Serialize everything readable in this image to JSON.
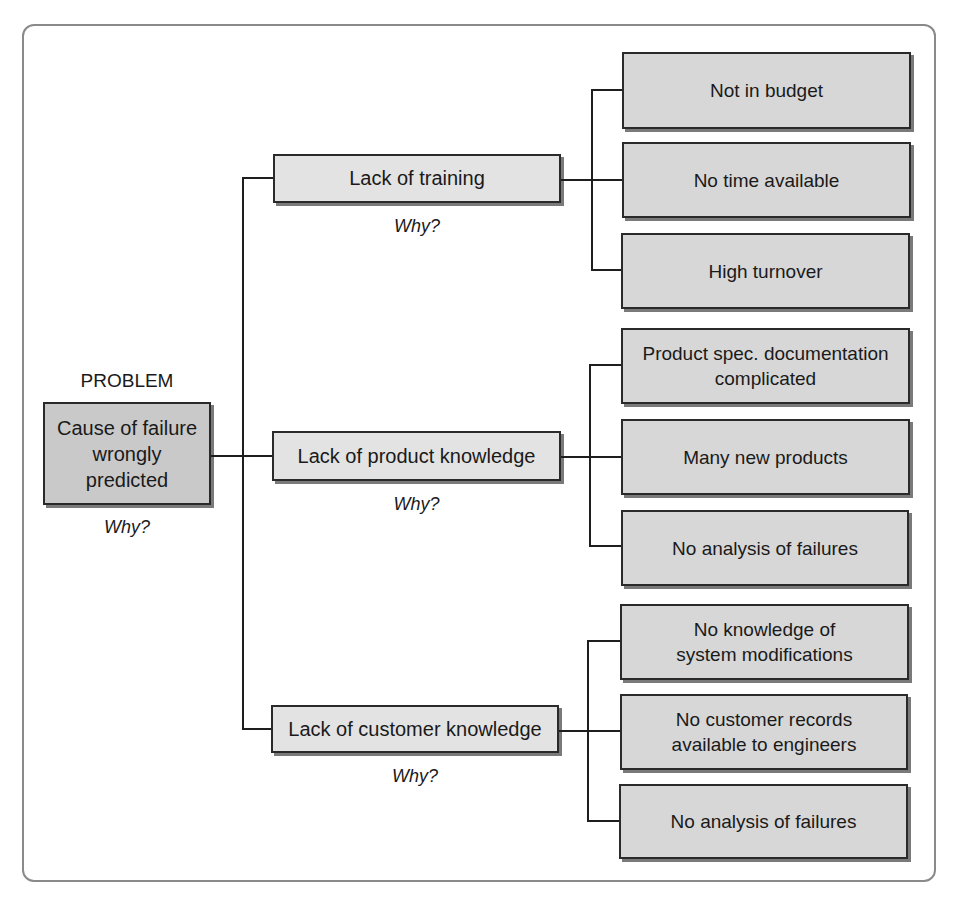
{
  "problem": {
    "heading": "PROBLEM",
    "text": "Cause of failure wrongly predicted",
    "why": "Why?"
  },
  "causes": [
    {
      "label": "Lack of training",
      "why": "Why?",
      "subcauses": [
        "Not in budget",
        "No time available",
        "High turnover"
      ]
    },
    {
      "label": "Lack of product knowledge",
      "why": "Why?",
      "subcauses": [
        "Product spec. documentation complicated",
        "Many new products",
        "No analysis of failures"
      ]
    },
    {
      "label": "Lack of customer knowledge",
      "why": "Why?",
      "subcauses": [
        "No knowledge of system modifications",
        "No customer records available to engineers",
        "No analysis of failures"
      ]
    }
  ],
  "colors": {
    "problem_fill": "#c9c9c9",
    "cause_fill": "#e3e3e3",
    "subcause_fill": "#d7d7d7",
    "line": "#1e1e1e",
    "frame": "#8a8a8a"
  }
}
